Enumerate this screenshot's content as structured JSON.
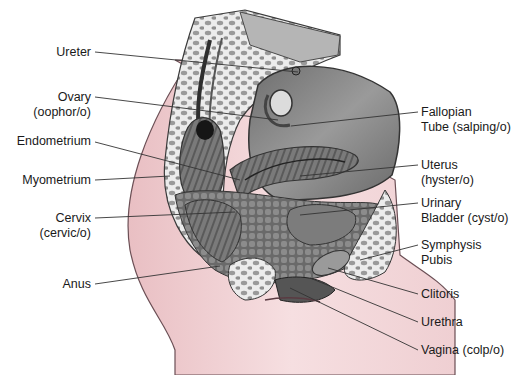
{
  "figure": {
    "type": "anatomical-diagram",
    "colors": {
      "skin": "#f2d6d8",
      "skin_outline": "#6b4f55",
      "tissue_dark": "#5e5e5e",
      "tissue_mid": "#8a8a8a",
      "tissue_light": "#c9c9c9",
      "bone_spongy": "#e4e4e4",
      "leader_line": "#333333"
    }
  },
  "labels_left": [
    {
      "id": "ureter",
      "line1": "Ureter",
      "line2": ""
    },
    {
      "id": "ovary",
      "line1": "Ovary",
      "line2": "(oophor/o)"
    },
    {
      "id": "endometrium",
      "line1": "Endometrium",
      "line2": ""
    },
    {
      "id": "myometrium",
      "line1": "Myometrium",
      "line2": ""
    },
    {
      "id": "cervix",
      "line1": "Cervix",
      "line2": "(cervic/o)"
    },
    {
      "id": "anus",
      "line1": "Anus",
      "line2": ""
    }
  ],
  "labels_right": [
    {
      "id": "fallopian-tube",
      "line1": "Fallopian",
      "line2": "Tube (salping/o)"
    },
    {
      "id": "uterus",
      "line1": "Uterus",
      "line2": "(hyster/o)"
    },
    {
      "id": "urinary-bladder",
      "line1": "Urinary",
      "line2": "Bladder (cyst/o)"
    },
    {
      "id": "symphysis-pubis",
      "line1": "Symphysis",
      "line2": "Pubis"
    },
    {
      "id": "clitoris",
      "line1": "Clitoris",
      "line2": ""
    },
    {
      "id": "urethra",
      "line1": "Urethra",
      "line2": ""
    },
    {
      "id": "vagina",
      "line1": "Vagina (colp/o)",
      "line2": ""
    }
  ]
}
